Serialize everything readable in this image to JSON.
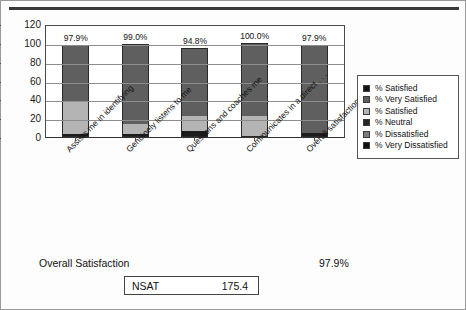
{
  "chart_data": {
    "type": "bar",
    "subtype": "stacked-column",
    "title": "",
    "xlabel": "",
    "ylabel": "",
    "ylim": [
      0,
      120
    ],
    "yticks": [
      0,
      20,
      40,
      60,
      80,
      100,
      120
    ],
    "grid": true,
    "legend_position": "right",
    "categories": [
      "Assists me in identifying",
      "Genuinely listens to me",
      "Questions and coaches me",
      "Communicates in a direct . . .",
      "Overall satisfaction with . . ."
    ],
    "data_labels": [
      "97.9%",
      "99.0%",
      "94.8%",
      "100.0%",
      "97.9%"
    ],
    "series": [
      {
        "name": "% Very Dissatisfied",
        "color": "#1c1c1c",
        "values": [
          2.1,
          2.0,
          5.2,
          0.0,
          3.1
        ]
      },
      {
        "name": "% Satisfied",
        "color": "#b4b4b4",
        "values": [
          36.0,
          11.0,
          17.0,
          22.0,
          0.0
        ]
      },
      {
        "name": "% Very Satisfied",
        "color": "#5f5f5f",
        "values": [
          59.8,
          86.0,
          72.6,
          78.0,
          94.8
        ]
      }
    ],
    "totals": [
      97.9,
      99.0,
      94.8,
      100.0,
      97.9
    ]
  },
  "legend": {
    "items": [
      {
        "label": "% Satisfied",
        "swatch": "#141414"
      },
      {
        "label": "% Very Satisfied",
        "swatch": "#5f5f5f"
      },
      {
        "label": "% Satisfied",
        "swatch": "#b4b4b4"
      },
      {
        "label": "% Neutral",
        "swatch": "#262626"
      },
      {
        "label": "% Dissatisfied",
        "swatch": "#7c7c7c"
      },
      {
        "label": "% Very Dissatisfied",
        "swatch": "#101010"
      }
    ]
  },
  "footer": {
    "overall_label": "Overall Satisfaction",
    "overall_value": "97.9%",
    "nsat_label": "NSAT",
    "nsat_value": "175.4"
  },
  "axis": {
    "ytick_labels": [
      "120",
      "100",
      "80",
      "60",
      "40",
      "20",
      "0"
    ]
  }
}
